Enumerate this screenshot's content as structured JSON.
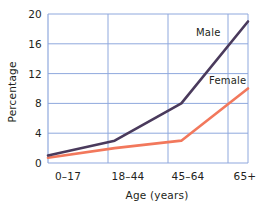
{
  "chart_data": {
    "type": "line",
    "title": "",
    "subtitle": "",
    "xlabel": "Age (years)",
    "ylabel": "Percentage",
    "categories": [
      "0–17",
      "18–44",
      "45–64",
      "65+"
    ],
    "series": [
      {
        "name": "Male",
        "color": "#4a3a5c",
        "values": [
          1,
          3,
          8,
          19
        ]
      },
      {
        "name": "Female",
        "color": "#f2785c",
        "values": [
          0.7,
          2,
          3,
          10
        ]
      }
    ],
    "ylim": [
      0,
      20
    ],
    "yticks": [
      0,
      4,
      8,
      12,
      16,
      20
    ],
    "ytick_labels": [
      "0",
      "4",
      "8",
      "12",
      "16",
      "20"
    ],
    "xtick_labels": [
      "0–17",
      "18–44",
      "45–64",
      "65+"
    ],
    "grid": true,
    "grid_color": "#8fa8dd",
    "legend": "inline-labels",
    "legend_position": "inline",
    "annotations": [
      {
        "text": "Male",
        "series": "Male",
        "x": 2.55,
        "y": 16.8
      },
      {
        "text": "Female",
        "series": "Female",
        "x": 2.85,
        "y": 11.5
      }
    ]
  },
  "axes": {
    "y_title": "Percentage",
    "x_title": "Age (years)"
  }
}
